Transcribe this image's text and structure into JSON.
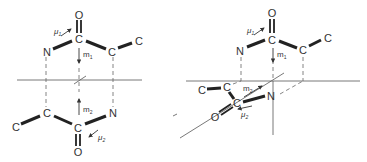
{
  "diagram": {
    "left_panel": {
      "description": "Two parallel dimer molecules (coplanar arrangement)",
      "upper_molecule": {
        "atoms": [
          "O",
          "C",
          "N",
          "C",
          "C"
        ],
        "dipole_label": "μ1",
        "moment_label": "m1"
      },
      "lower_molecule": {
        "atoms": [
          "C",
          "C",
          "C",
          "N",
          "O"
        ],
        "dipole_label": "μ2",
        "moment_label": "m2"
      }
    },
    "right_panel": {
      "description": "Lower molecule rotated out of plane",
      "upper_molecule": {
        "atoms": [
          "O",
          "C",
          "N",
          "C",
          "C"
        ],
        "dipole_label": "μ1",
        "moment_label": "m1"
      },
      "lower_molecule": {
        "atoms": [
          "C",
          "C",
          "C",
          "N",
          "O"
        ],
        "dipole_label": "μ2",
        "moment_label": "m2"
      }
    },
    "atom_labels": {
      "O": "O",
      "C": "C",
      "N": "N"
    },
    "labels": {
      "mu1": "μ",
      "mu1_sub": "1",
      "mu2": "μ",
      "mu2_sub": "2",
      "m1": "m",
      "m1_sub": "1",
      "m2": "m",
      "m2_sub": "2"
    }
  }
}
